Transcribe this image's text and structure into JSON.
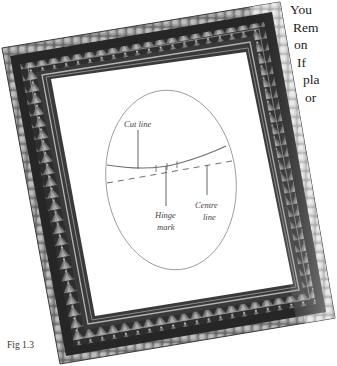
{
  "body_text": {
    "lines": [
      "You",
      "Rem",
      "on",
      "If",
      "pla",
      "or"
    ],
    "indents": [
      0,
      3,
      4,
      7,
      13,
      15
    ]
  },
  "figure": {
    "caption": "Fig 1.3",
    "labels": {
      "cut_line": "Cut line",
      "hinge_mark_1": "Hinge",
      "hinge_mark_2": "mark",
      "centre_line_1": "Centre",
      "centre_line_2": "line"
    },
    "colors": {
      "frame_dark": "#2a2a2a",
      "frame_mid": "#5a5a5a",
      "frame_light": "#c8c8c8",
      "mount": "#ffffff",
      "line": "#777777"
    }
  }
}
